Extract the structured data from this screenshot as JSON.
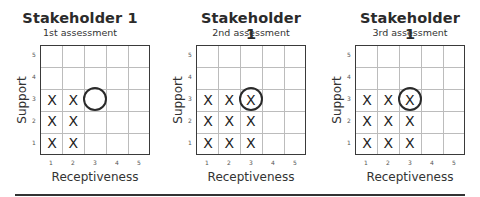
{
  "panels": [
    {
      "title": "Stakeholder 1",
      "subtitle": "1st assessment",
      "ylabel": "Support",
      "xlabel": "Receptiveness",
      "x_ticks": [
        "1",
        "2",
        "3",
        "4",
        "5"
      ],
      "y_ticks": [
        "5",
        "4",
        "3",
        "2",
        "1"
      ],
      "marks": [
        {
          "x": 1,
          "y": 1,
          "symbol": "X"
        },
        {
          "x": 2,
          "y": 1,
          "symbol": "X"
        },
        {
          "x": 1,
          "y": 2,
          "symbol": "X"
        },
        {
          "x": 2,
          "y": 2,
          "symbol": "X"
        },
        {
          "x": 1,
          "y": 3,
          "symbol": "X"
        },
        {
          "x": 2,
          "y": 3,
          "symbol": "X"
        }
      ],
      "circle": {
        "x": 3,
        "y": 3
      }
    },
    {
      "title": "Stakeholder 1",
      "subtitle": "2nd assessment",
      "ylabel": "Support",
      "xlabel": "Receptiveness",
      "x_ticks": [
        "1",
        "2",
        "3",
        "4",
        "5"
      ],
      "y_ticks": [
        "5",
        "4",
        "3",
        "2",
        "1"
      ],
      "marks": [
        {
          "x": 1,
          "y": 1,
          "symbol": "X"
        },
        {
          "x": 2,
          "y": 1,
          "symbol": "X"
        },
        {
          "x": 3,
          "y": 1,
          "symbol": "X"
        },
        {
          "x": 1,
          "y": 2,
          "symbol": "X"
        },
        {
          "x": 2,
          "y": 2,
          "symbol": "X"
        },
        {
          "x": 3,
          "y": 2,
          "symbol": "X"
        },
        {
          "x": 1,
          "y": 3,
          "symbol": "X"
        },
        {
          "x": 2,
          "y": 3,
          "symbol": "X"
        },
        {
          "x": 3,
          "y": 3,
          "symbol": "X"
        }
      ],
      "circle": {
        "x": 3,
        "y": 3
      }
    },
    {
      "title": "Stakeholder 1",
      "subtitle": "3rd assessment",
      "ylabel": "Support",
      "xlabel": "Receptiveness",
      "x_ticks": [
        "1",
        "2",
        "3",
        "4",
        "5"
      ],
      "y_ticks": [
        "5",
        "4",
        "3",
        "2",
        "1"
      ],
      "marks": [
        {
          "x": 1,
          "y": 1,
          "symbol": "X"
        },
        {
          "x": 2,
          "y": 1,
          "symbol": "X"
        },
        {
          "x": 3,
          "y": 1,
          "symbol": "X"
        },
        {
          "x": 1,
          "y": 2,
          "symbol": "X"
        },
        {
          "x": 2,
          "y": 2,
          "symbol": "X"
        },
        {
          "x": 3,
          "y": 2,
          "symbol": "X"
        },
        {
          "x": 1,
          "y": 3,
          "symbol": "X"
        },
        {
          "x": 2,
          "y": 3,
          "symbol": "X"
        },
        {
          "x": 3,
          "y": 3,
          "symbol": "X"
        }
      ],
      "circle": {
        "x": 3,
        "y": 3
      }
    }
  ]
}
